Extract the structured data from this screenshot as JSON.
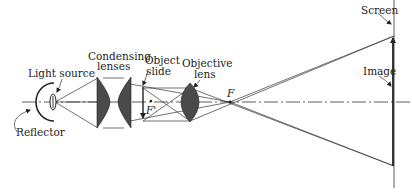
{
  "diagram": {
    "labels": {
      "light_source": "Light source",
      "reflector": "Reflector",
      "condensing_line1": "Condensing",
      "condensing_line2": "lenses",
      "object_line1": "Object",
      "object_line2": "slide",
      "objective_line1": "Objective",
      "objective_line2": "lens",
      "focal_point": "F",
      "focal_point_prime": "F'",
      "screen": "Screen",
      "image": "Image"
    },
    "colors": {
      "ink": "#222222",
      "lens_fill": "#4a4a4a",
      "background": "#ffffff"
    }
  }
}
